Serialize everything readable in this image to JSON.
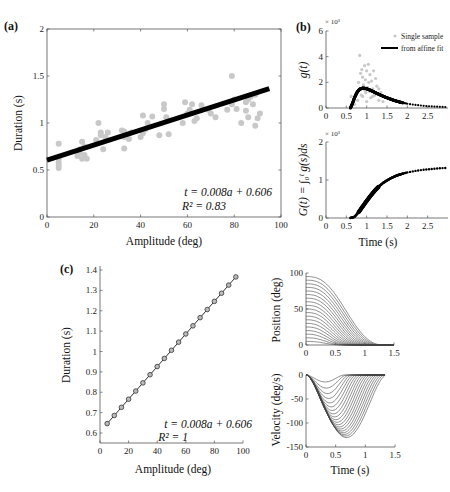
{
  "chart_data": [
    {
      "id": "a",
      "panel_label": "(a)",
      "type": "scatter",
      "xlabel": "Amplitude (deg)",
      "ylabel": "Duration (s)",
      "xlim": [
        0,
        100
      ],
      "ylim": [
        0,
        2
      ],
      "xticks": [
        0,
        20,
        40,
        60,
        80,
        100
      ],
      "yticks": [
        0,
        0.5,
        1,
        1.5,
        2
      ],
      "grid": false,
      "annotation": [
        "t = 0.008a + 0.606",
        "R² = 0.83"
      ],
      "fit_line": {
        "slope": 0.008,
        "intercept": 0.606,
        "x_range": [
          0,
          95
        ]
      },
      "series": [
        {
          "name": "Single samples",
          "color": "#c8c8c8",
          "points": [
            [
              5,
              0.55
            ],
            [
              5,
              0.52
            ],
            [
              5,
              0.58
            ],
            [
              5,
              0.62
            ],
            [
              5,
              0.78
            ],
            [
              13,
              0.65
            ],
            [
              14,
              0.68
            ],
            [
              14,
              0.72
            ],
            [
              15,
              0.62
            ],
            [
              15,
              0.8
            ],
            [
              16,
              0.75
            ],
            [
              16,
              0.66
            ],
            [
              17,
              0.62
            ],
            [
              21,
              0.82
            ],
            [
              22,
              1.0
            ],
            [
              23,
              0.9
            ],
            [
              23,
              0.87
            ],
            [
              24,
              0.72
            ],
            [
              25,
              0.85
            ],
            [
              26,
              0.9
            ],
            [
              32,
              0.92
            ],
            [
              33,
              0.91
            ],
            [
              33,
              0.85
            ],
            [
              33,
              0.73
            ],
            [
              34,
              0.88
            ],
            [
              35,
              0.83
            ],
            [
              36,
              0.9
            ],
            [
              40,
              0.85
            ],
            [
              41,
              0.89
            ],
            [
              41,
              1.08
            ],
            [
              42,
              0.93
            ],
            [
              43,
              1.0
            ],
            [
              45,
              1.07
            ],
            [
              48,
              0.87
            ],
            [
              50,
              1.2
            ],
            [
              50,
              1.15
            ],
            [
              51,
              1.06
            ],
            [
              52,
              0.88
            ],
            [
              58,
              1.0
            ],
            [
              59,
              1.22
            ],
            [
              60,
              1.1
            ],
            [
              61,
              1.14
            ],
            [
              62,
              1.2
            ],
            [
              63,
              1.02
            ],
            [
              64,
              1.05
            ],
            [
              66,
              1.19
            ],
            [
              69,
              1.14
            ],
            [
              70,
              1.1
            ],
            [
              72,
              1.06
            ],
            [
              77,
              1.14
            ],
            [
              79,
              1.5
            ],
            [
              79,
              1.2
            ],
            [
              80,
              1.25
            ],
            [
              81,
              1.15
            ],
            [
              83,
              1.0
            ],
            [
              85,
              1.13
            ],
            [
              85,
              1.22
            ],
            [
              86,
              1.25
            ],
            [
              86,
              1.06
            ],
            [
              87,
              1.28
            ],
            [
              88,
              1.2
            ],
            [
              89,
              0.97
            ],
            [
              89,
              1.3
            ],
            [
              90,
              1.05
            ],
            [
              91,
              1.1
            ]
          ]
        }
      ]
    },
    {
      "id": "b_top",
      "panel_label": "(b)",
      "type": "scatter",
      "xlabel": "",
      "ylabel": "g(t)",
      "y_multiplier": "× 10³",
      "xlim": [
        0,
        3
      ],
      "ylim": [
        0,
        6
      ],
      "xticks": [
        0,
        0.5,
        1,
        1.5,
        2,
        2.5
      ],
      "yticks": [
        0,
        2,
        4,
        6
      ],
      "legend": [
        "Single sample",
        "from affine fit"
      ],
      "legend_position": "upper right",
      "series": [
        {
          "name": "Single sample",
          "color": "#c8c8c8",
          "points": [
            [
              0.62,
              0.9
            ],
            [
              0.7,
              0.3
            ],
            [
              0.75,
              1.2
            ],
            [
              0.78,
              0.6
            ],
            [
              0.8,
              2.0
            ],
            [
              0.82,
              1.5
            ],
            [
              0.83,
              4.1
            ],
            [
              0.85,
              2.7
            ],
            [
              0.87,
              1.0
            ],
            [
              0.88,
              3.0
            ],
            [
              0.9,
              2.4
            ],
            [
              0.92,
              1.8
            ],
            [
              0.95,
              3.3
            ],
            [
              0.97,
              2.2
            ],
            [
              0.98,
              1.2
            ],
            [
              1.0,
              2.9
            ],
            [
              1.02,
              1.6
            ],
            [
              1.04,
              3.4
            ],
            [
              1.05,
              2.0
            ],
            [
              1.07,
              1.3
            ],
            [
              1.08,
              2.6
            ],
            [
              1.1,
              0.8
            ],
            [
              1.12,
              2.1
            ],
            [
              1.15,
              1.5
            ],
            [
              1.17,
              2.9
            ],
            [
              1.2,
              1.0
            ],
            [
              1.22,
              2.3
            ],
            [
              1.25,
              1.7
            ],
            [
              1.3,
              0.6
            ],
            [
              1.35,
              1.2
            ],
            [
              1.4,
              0.5
            ],
            [
              0.9,
              0.9
            ],
            [
              1.0,
              0.5
            ],
            [
              0.95,
              1.4
            ],
            [
              1.15,
              0.9
            ],
            [
              1.3,
              1.5
            ]
          ]
        },
        {
          "name": "from affine fit",
          "color": "#000000",
          "points": [
            [
              0.6,
              0.0
            ],
            [
              0.65,
              0.35
            ],
            [
              0.7,
              0.8
            ],
            [
              0.75,
              1.15
            ],
            [
              0.8,
              1.38
            ],
            [
              0.85,
              1.5
            ],
            [
              0.9,
              1.55
            ],
            [
              0.95,
              1.54
            ],
            [
              1.0,
              1.5
            ],
            [
              1.1,
              1.38
            ],
            [
              1.2,
              1.22
            ],
            [
              1.3,
              1.07
            ],
            [
              1.4,
              0.93
            ],
            [
              1.5,
              0.8
            ],
            [
              1.6,
              0.68
            ],
            [
              1.7,
              0.57
            ],
            [
              1.8,
              0.48
            ],
            [
              1.9,
              0.4
            ],
            [
              2.0,
              0.33
            ],
            [
              2.2,
              0.24
            ],
            [
              2.4,
              0.17
            ],
            [
              2.6,
              0.12
            ],
            [
              2.8,
              0.09
            ],
            [
              3.0,
              0.07
            ]
          ]
        }
      ]
    },
    {
      "id": "b_bottom",
      "panel_label": "",
      "type": "line",
      "xlabel": "Time (s)",
      "ylabel": "G(t) = ∫₀ᵗ g(s)ds",
      "y_multiplier": "× 10³",
      "xlim": [
        0,
        3
      ],
      "ylim": [
        0,
        2
      ],
      "xticks": [
        0,
        0.5,
        1,
        1.5,
        2,
        2.5
      ],
      "yticks": [
        0,
        1,
        2
      ],
      "series": [
        {
          "name": "G(t)",
          "color": "#000000",
          "points": [
            [
              0.6,
              0.0
            ],
            [
              0.7,
              0.03
            ],
            [
              0.8,
              0.15
            ],
            [
              0.9,
              0.3
            ],
            [
              1.0,
              0.45
            ],
            [
              1.1,
              0.59
            ],
            [
              1.2,
              0.72
            ],
            [
              1.3,
              0.83
            ],
            [
              1.4,
              0.92
            ],
            [
              1.5,
              0.99
            ],
            [
              1.6,
              1.05
            ],
            [
              1.7,
              1.1
            ],
            [
              1.8,
              1.14
            ],
            [
              1.9,
              1.17
            ],
            [
              2.0,
              1.2
            ],
            [
              2.2,
              1.24
            ],
            [
              2.4,
              1.27
            ],
            [
              2.6,
              1.29
            ],
            [
              2.8,
              1.31
            ],
            [
              3.0,
              1.32
            ]
          ]
        }
      ]
    },
    {
      "id": "c",
      "panel_label": "(c)",
      "type": "line",
      "xlabel": "Amplitude (deg)",
      "ylabel": "Duration (s)",
      "xlim": [
        0,
        100
      ],
      "ylim": [
        0.55,
        1.4
      ],
      "xticks": [
        0,
        20,
        40,
        60,
        80,
        100
      ],
      "yticks": [
        0.6,
        0.7,
        0.8,
        0.9,
        1,
        1.1,
        1.2,
        1.3,
        1.4
      ],
      "annotation": [
        "t = 0.008a + 0.606",
        "R² = 1"
      ],
      "series": [
        {
          "name": "Duration",
          "color": "#333333",
          "marker": "circle",
          "x": [
            5,
            10,
            15,
            20,
            25,
            30,
            35,
            40,
            45,
            50,
            55,
            60,
            65,
            70,
            75,
            80,
            85,
            90,
            95
          ],
          "values": [
            0.646,
            0.686,
            0.726,
            0.766,
            0.806,
            0.846,
            0.886,
            0.926,
            0.966,
            1.006,
            1.046,
            1.086,
            1.126,
            1.166,
            1.206,
            1.246,
            1.286,
            1.326,
            1.366
          ]
        }
      ]
    },
    {
      "id": "position",
      "panel_label": "",
      "type": "line",
      "xlabel": "",
      "ylabel": "Position (deg)",
      "xlim": [
        0,
        1.5
      ],
      "ylim": [
        0,
        100
      ],
      "xticks": [
        0,
        0.5,
        1,
        1.5
      ],
      "yticks": [
        0,
        50,
        100
      ],
      "description": "19 minimum-jerk-like sigmoid curves, amplitudes 5 to 95 deg, each decaying to 0; durations 0.646 to 1.366 s",
      "amplitudes": [
        5,
        10,
        15,
        20,
        25,
        30,
        35,
        40,
        45,
        50,
        55,
        60,
        65,
        70,
        75,
        80,
        85,
        90,
        95
      ]
    },
    {
      "id": "velocity",
      "panel_label": "",
      "type": "line",
      "xlabel": "Time (s)",
      "ylabel": "Velocity (deg/s)",
      "xlim": [
        0,
        1.5
      ],
      "ylim": [
        -150,
        0
      ],
      "xticks": [
        0,
        0.5,
        1,
        1.5
      ],
      "yticks": [
        -150,
        -100,
        -50,
        0
      ],
      "description": "Velocity profiles for the 19 movements; peak ≈ -15 (5 deg) to ≈ -135 (95 deg) deg/s",
      "amplitudes": [
        5,
        10,
        15,
        20,
        25,
        30,
        35,
        40,
        45,
        50,
        55,
        60,
        65,
        70,
        75,
        80,
        85,
        90,
        95
      ]
    }
  ]
}
